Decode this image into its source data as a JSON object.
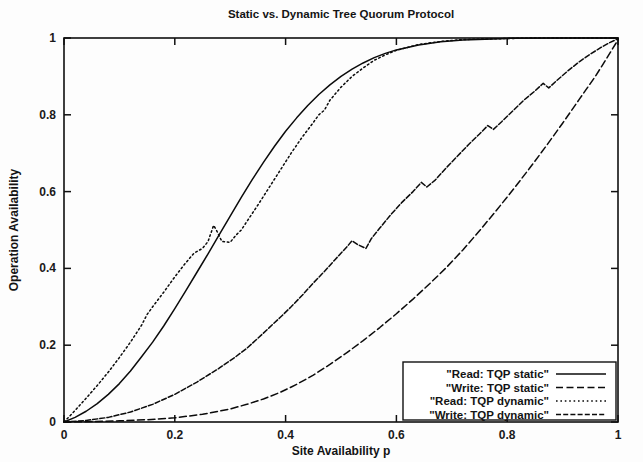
{
  "chart_data": {
    "type": "line",
    "title": "Static vs. Dynamic Tree Quorum Protocol",
    "xlabel": "Site Availability p",
    "ylabel": "Operation Availability",
    "xlim": [
      0,
      1
    ],
    "ylim": [
      0,
      1
    ],
    "xticks": [
      "0",
      "0.2",
      "0.4",
      "0.6",
      "0.8",
      "1"
    ],
    "xtick_values": [
      0,
      0.2,
      0.4,
      0.6,
      0.8,
      1
    ],
    "yticks": [
      "0",
      "0.2",
      "0.4",
      "0.6",
      "0.8",
      "1"
    ],
    "ytick_values": [
      0,
      0.2,
      0.4,
      0.6,
      0.8,
      1
    ],
    "grid": false,
    "legend_position": "bottom-right",
    "series": [
      {
        "name": "\"Read: TQP static\"",
        "dash": "solid",
        "points": [
          [
            0.0,
            0.0
          ],
          [
            0.02,
            0.012
          ],
          [
            0.04,
            0.028
          ],
          [
            0.06,
            0.048
          ],
          [
            0.08,
            0.072
          ],
          [
            0.1,
            0.1
          ],
          [
            0.12,
            0.133
          ],
          [
            0.14,
            0.17
          ],
          [
            0.16,
            0.208
          ],
          [
            0.18,
            0.25
          ],
          [
            0.2,
            0.295
          ],
          [
            0.22,
            0.342
          ],
          [
            0.24,
            0.39
          ],
          [
            0.26,
            0.438
          ],
          [
            0.28,
            0.487
          ],
          [
            0.3,
            0.536
          ],
          [
            0.32,
            0.585
          ],
          [
            0.34,
            0.632
          ],
          [
            0.36,
            0.676
          ],
          [
            0.38,
            0.718
          ],
          [
            0.4,
            0.757
          ],
          [
            0.42,
            0.792
          ],
          [
            0.44,
            0.824
          ],
          [
            0.46,
            0.853
          ],
          [
            0.48,
            0.878
          ],
          [
            0.5,
            0.9
          ],
          [
            0.52,
            0.919
          ],
          [
            0.54,
            0.935
          ],
          [
            0.56,
            0.949
          ],
          [
            0.58,
            0.96
          ],
          [
            0.6,
            0.969
          ],
          [
            0.64,
            0.982
          ],
          [
            0.68,
            0.99
          ],
          [
            0.72,
            0.995
          ],
          [
            0.76,
            0.997
          ],
          [
            0.8,
            0.999
          ],
          [
            0.9,
            1.0
          ],
          [
            1.0,
            1.0
          ]
        ]
      },
      {
        "name": "\"Write: TQP static\"",
        "dash": "dashed",
        "points": [
          [
            0.0,
            0.0
          ],
          [
            0.05,
            0.001
          ],
          [
            0.1,
            0.003
          ],
          [
            0.15,
            0.006
          ],
          [
            0.2,
            0.011
          ],
          [
            0.25,
            0.02
          ],
          [
            0.3,
            0.034
          ],
          [
            0.33,
            0.046
          ],
          [
            0.36,
            0.06
          ],
          [
            0.39,
            0.077
          ],
          [
            0.42,
            0.098
          ],
          [
            0.45,
            0.122
          ],
          [
            0.48,
            0.15
          ],
          [
            0.51,
            0.18
          ],
          [
            0.54,
            0.212
          ],
          [
            0.57,
            0.246
          ],
          [
            0.6,
            0.282
          ],
          [
            0.63,
            0.32
          ],
          [
            0.66,
            0.36
          ],
          [
            0.69,
            0.402
          ],
          [
            0.72,
            0.448
          ],
          [
            0.75,
            0.498
          ],
          [
            0.78,
            0.55
          ],
          [
            0.81,
            0.604
          ],
          [
            0.84,
            0.66
          ],
          [
            0.87,
            0.718
          ],
          [
            0.9,
            0.778
          ],
          [
            0.93,
            0.84
          ],
          [
            0.96,
            0.902
          ],
          [
            0.98,
            0.948
          ],
          [
            1.0,
            0.995
          ]
        ]
      },
      {
        "name": "\"Read: TQP dynamic\"",
        "dash": "dotted",
        "points": [
          [
            0.0,
            0.0
          ],
          [
            0.02,
            0.03
          ],
          [
            0.04,
            0.062
          ],
          [
            0.06,
            0.095
          ],
          [
            0.08,
            0.13
          ],
          [
            0.1,
            0.168
          ],
          [
            0.12,
            0.208
          ],
          [
            0.14,
            0.252
          ],
          [
            0.15,
            0.28
          ],
          [
            0.16,
            0.3
          ],
          [
            0.18,
            0.338
          ],
          [
            0.2,
            0.378
          ],
          [
            0.22,
            0.415
          ],
          [
            0.235,
            0.44
          ],
          [
            0.25,
            0.452
          ],
          [
            0.26,
            0.47
          ],
          [
            0.27,
            0.512
          ],
          [
            0.275,
            0.5
          ],
          [
            0.285,
            0.47
          ],
          [
            0.3,
            0.468
          ],
          [
            0.31,
            0.486
          ],
          [
            0.32,
            0.5
          ],
          [
            0.33,
            0.522
          ],
          [
            0.35,
            0.565
          ],
          [
            0.37,
            0.61
          ],
          [
            0.39,
            0.655
          ],
          [
            0.41,
            0.7
          ],
          [
            0.43,
            0.742
          ],
          [
            0.45,
            0.78
          ],
          [
            0.46,
            0.8
          ],
          [
            0.47,
            0.812
          ],
          [
            0.48,
            0.838
          ],
          [
            0.5,
            0.872
          ],
          [
            0.52,
            0.9
          ],
          [
            0.54,
            0.922
          ],
          [
            0.56,
            0.942
          ],
          [
            0.58,
            0.956
          ],
          [
            0.6,
            0.968
          ],
          [
            0.64,
            0.983
          ],
          [
            0.68,
            0.991
          ],
          [
            0.72,
            0.996
          ],
          [
            0.78,
            0.998
          ],
          [
            0.85,
            1.0
          ],
          [
            1.0,
            1.0
          ]
        ]
      },
      {
        "name": "\"Write: TQP dynamic\"",
        "dash": "dashdash",
        "points": [
          [
            0.0,
            0.0
          ],
          [
            0.04,
            0.004
          ],
          [
            0.08,
            0.012
          ],
          [
            0.12,
            0.026
          ],
          [
            0.16,
            0.046
          ],
          [
            0.2,
            0.072
          ],
          [
            0.24,
            0.104
          ],
          [
            0.28,
            0.14
          ],
          [
            0.31,
            0.17
          ],
          [
            0.33,
            0.192
          ],
          [
            0.35,
            0.218
          ],
          [
            0.37,
            0.245
          ],
          [
            0.39,
            0.272
          ],
          [
            0.41,
            0.3
          ],
          [
            0.43,
            0.33
          ],
          [
            0.45,
            0.362
          ],
          [
            0.47,
            0.392
          ],
          [
            0.49,
            0.424
          ],
          [
            0.51,
            0.455
          ],
          [
            0.52,
            0.472
          ],
          [
            0.53,
            0.462
          ],
          [
            0.545,
            0.452
          ],
          [
            0.555,
            0.478
          ],
          [
            0.57,
            0.505
          ],
          [
            0.59,
            0.54
          ],
          [
            0.61,
            0.572
          ],
          [
            0.63,
            0.6
          ],
          [
            0.645,
            0.624
          ],
          [
            0.655,
            0.612
          ],
          [
            0.67,
            0.63
          ],
          [
            0.69,
            0.662
          ],
          [
            0.71,
            0.692
          ],
          [
            0.73,
            0.722
          ],
          [
            0.75,
            0.75
          ],
          [
            0.765,
            0.772
          ],
          [
            0.775,
            0.762
          ],
          [
            0.79,
            0.782
          ],
          [
            0.81,
            0.81
          ],
          [
            0.83,
            0.838
          ],
          [
            0.85,
            0.862
          ],
          [
            0.865,
            0.882
          ],
          [
            0.875,
            0.87
          ],
          [
            0.89,
            0.89
          ],
          [
            0.91,
            0.915
          ],
          [
            0.93,
            0.938
          ],
          [
            0.95,
            0.958
          ],
          [
            0.97,
            0.976
          ],
          [
            0.985,
            0.988
          ],
          [
            1.0,
            0.998
          ]
        ]
      }
    ]
  },
  "legend": {
    "entries": [
      {
        "label": "\"Read: TQP static\"",
        "dash": "solid"
      },
      {
        "label": "\"Write: TQP static\"",
        "dash": "dashed"
      },
      {
        "label": "\"Read: TQP dynamic\"",
        "dash": "dotted"
      },
      {
        "label": "\"Write: TQP dynamic\"",
        "dash": "dashdash"
      }
    ]
  },
  "style": {
    "ink": "#0b0b0b",
    "background": "#fdfdfd"
  }
}
